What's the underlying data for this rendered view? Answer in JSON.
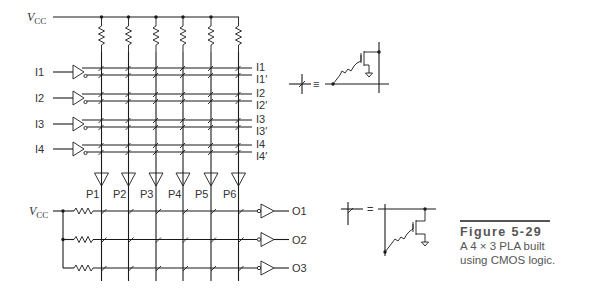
{
  "figure": {
    "number": "Figure 5-29",
    "caption_line1": "A 4 × 3 PLA built",
    "caption_line2": "using CMOS logic.",
    "rule_color": "#555555"
  },
  "vcc": {
    "top_label": "V",
    "top_sub": "CC",
    "bottom_label": "V",
    "bottom_sub": "CC"
  },
  "inputs": [
    {
      "label": "I1",
      "true_label": "I1",
      "comp_label": "I1′"
    },
    {
      "label": "I2",
      "true_label": "I2",
      "comp_label": "I2′"
    },
    {
      "label": "I3",
      "true_label": "I3",
      "comp_label": "I3′"
    },
    {
      "label": "I4",
      "true_label": "I4",
      "comp_label": "I4′"
    }
  ],
  "products": [
    "P1",
    "P2",
    "P3",
    "P4",
    "P5",
    "P6"
  ],
  "outputs": [
    "O1",
    "O2",
    "O3"
  ],
  "legend": {
    "and_plane_equiv": "≡",
    "or_plane_equiv": "="
  },
  "line_color": "#1a1a1a"
}
